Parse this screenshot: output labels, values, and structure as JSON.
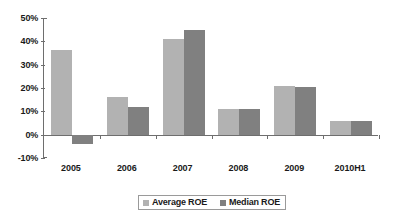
{
  "chart_data": {
    "type": "bar",
    "title": "",
    "subtitle": "",
    "xlabel": "",
    "ylabel": "",
    "categories": [
      "2005",
      "2006",
      "2007",
      "2008",
      "2009",
      "2010H1"
    ],
    "series": [
      {
        "name": "Average ROE",
        "color": "#b2b2b2",
        "values": [
          36.5,
          16.0,
          41.0,
          11.0,
          21.0,
          6.0
        ]
      },
      {
        "name": "Median ROE",
        "color": "#808080",
        "values": [
          -4.0,
          12.0,
          45.0,
          11.0,
          20.5,
          6.0
        ]
      }
    ],
    "ylim": [
      -10,
      50
    ],
    "ytick_labels": [
      "50%",
      "40%",
      "30%",
      "20%",
      "10%",
      "0%",
      "-10%"
    ],
    "ytick_values": [
      50,
      40,
      30,
      20,
      10,
      0,
      -10
    ],
    "grid": false,
    "legend_position": "bottom",
    "legend_entries": [
      "Average ROE",
      "Median ROE"
    ],
    "axis_color": "#6e6e6e",
    "background": "#ffffff"
  }
}
